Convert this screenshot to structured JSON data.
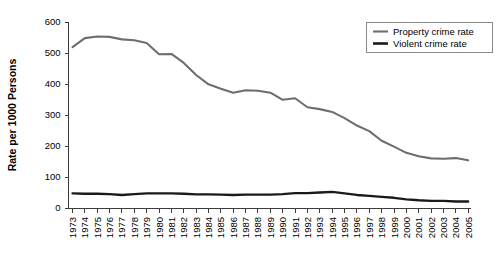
{
  "chart_data": {
    "type": "line",
    "title": "",
    "xlabel": "",
    "ylabel": "Rate per 1000 Persons",
    "ylim": [
      0,
      600
    ],
    "yticks": [
      0,
      100,
      200,
      300,
      400,
      500,
      600
    ],
    "grid": false,
    "legend_position": "top-right",
    "x": [
      "1973",
      "1974",
      "1975",
      "1976",
      "1977",
      "1978",
      "1979",
      "1980",
      "1981",
      "1982",
      "1983",
      "1984",
      "1985",
      "1986",
      "1987",
      "1988",
      "1989",
      "1990",
      "1991",
      "1992",
      "1993",
      "1994",
      "1995",
      "1996",
      "1997",
      "1998",
      "1999",
      "2000",
      "2001",
      "2002",
      "2003",
      "2004",
      "2005"
    ],
    "series": [
      {
        "name": "Property crime rate",
        "color": "#6e6e6e",
        "values": [
          519,
          548,
          553,
          552,
          544,
          541,
          532,
          496,
          497,
          468,
          429,
          399,
          385,
          372,
          380,
          378,
          372,
          349,
          354,
          325,
          319,
          310,
          290,
          266,
          248,
          217,
          198,
          178,
          167,
          160,
          159,
          161,
          154
        ]
      },
      {
        "name": "Violent crime rate",
        "color": "#1a1a1a",
        "values": [
          47,
          46,
          46,
          45,
          42,
          45,
          47,
          47,
          47,
          46,
          44,
          44,
          43,
          42,
          43,
          43,
          43,
          45,
          48,
          48,
          50,
          52,
          47,
          42,
          39,
          36,
          33,
          28,
          25,
          23,
          23,
          21,
          21
        ]
      }
    ]
  },
  "legend": {
    "entries": [
      {
        "label": "Property crime rate",
        "swatch": "line-swatch-gray"
      },
      {
        "label": "Violent crime rate",
        "swatch": "line-swatch-black"
      }
    ]
  },
  "axes": {
    "y_title": "Rate per 1000 Persons"
  }
}
